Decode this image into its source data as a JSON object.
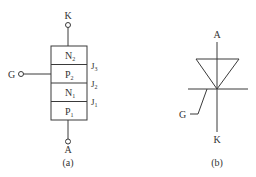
{
  "figure_a": {
    "caption": "(a)",
    "terminals": {
      "cathode": "K",
      "gate": "G",
      "anode": "A"
    },
    "layers": [
      {
        "base": "N",
        "sub": "2"
      },
      {
        "base": "P",
        "sub": "2"
      },
      {
        "base": "N",
        "sub": "1"
      },
      {
        "base": "P",
        "sub": "1"
      }
    ],
    "junctions": [
      {
        "base": "J",
        "sub": "3"
      },
      {
        "base": "J",
        "sub": "2"
      },
      {
        "base": "J",
        "sub": "1"
      }
    ]
  },
  "figure_b": {
    "caption": "(b)",
    "terminals": {
      "anode": "A",
      "gate": "G",
      "cathode": "K"
    }
  },
  "colors": {
    "line": "#3a3a3a",
    "text": "#333333",
    "background": "#ffffff"
  }
}
